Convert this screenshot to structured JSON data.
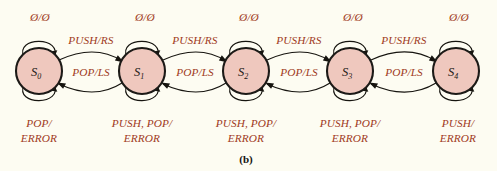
{
  "figure": {
    "caption": "(b)",
    "background_color": "#fdfcf2",
    "state_fill_color": "#efc8be",
    "state_stroke_color": "#1c1a17",
    "label_color": "#a03a22",
    "edge_color": "#16140f"
  },
  "states": [
    {
      "id": "S0",
      "name": "S",
      "subscript": "0",
      "cx": 39,
      "cy": 71,
      "r": 23,
      "top_loop_label": "Ø/Ø",
      "bottom_loop_label_line1": "POP/",
      "bottom_loop_label_line2": "ERROR"
    },
    {
      "id": "S1",
      "name": "S",
      "subscript": "1",
      "cx": 142,
      "cy": 71,
      "r": 23,
      "top_loop_label": "Ø/Ø",
      "bottom_loop_label_line1": "PUSH, POP/",
      "bottom_loop_label_line2": "ERROR"
    },
    {
      "id": "S2",
      "name": "S",
      "subscript": "2",
      "cx": 246,
      "cy": 71,
      "r": 23,
      "top_loop_label": "Ø/Ø",
      "bottom_loop_label_line1": "PUSH, POP/",
      "bottom_loop_label_line2": "ERROR"
    },
    {
      "id": "S3",
      "name": "S",
      "subscript": "3",
      "cx": 350,
      "cy": 71,
      "r": 23,
      "top_loop_label": "Ø/Ø",
      "bottom_loop_label_line1": "PUSH, POP/",
      "bottom_loop_label_line2": "ERROR"
    },
    {
      "id": "S4",
      "name": "S",
      "subscript": "4",
      "cx": 456,
      "cy": 71,
      "r": 23,
      "top_loop_label": "Ø/Ø",
      "bottom_loop_label_line1": "PUSH/",
      "bottom_loop_label_line2": "ERROR"
    }
  ],
  "transitions": [
    {
      "from": "S0",
      "to": "S1",
      "label": "PUSH/RS",
      "direction": "forward",
      "label_x": 90,
      "label_y": 44
    },
    {
      "from": "S1",
      "to": "S0",
      "label": "POP/LS",
      "direction": "backward",
      "label_x": 90,
      "label_y": 75
    },
    {
      "from": "S1",
      "to": "S2",
      "label": "PUSH/RS",
      "direction": "forward",
      "label_x": 194,
      "label_y": 44
    },
    {
      "from": "S2",
      "to": "S1",
      "label": "POP/LS",
      "direction": "backward",
      "label_x": 194,
      "label_y": 75
    },
    {
      "from": "S2",
      "to": "S3",
      "label": "PUSH/RS",
      "direction": "forward",
      "label_x": 298,
      "label_y": 44
    },
    {
      "from": "S3",
      "to": "S2",
      "label": "POP/LS",
      "direction": "backward",
      "label_x": 298,
      "label_y": 75
    },
    {
      "from": "S3",
      "to": "S4",
      "label": "PUSH/RS",
      "direction": "forward",
      "label_x": 403,
      "label_y": 44
    },
    {
      "from": "S4",
      "to": "S3",
      "label": "POP/LS",
      "direction": "backward",
      "label_x": 403,
      "label_y": 75
    }
  ]
}
